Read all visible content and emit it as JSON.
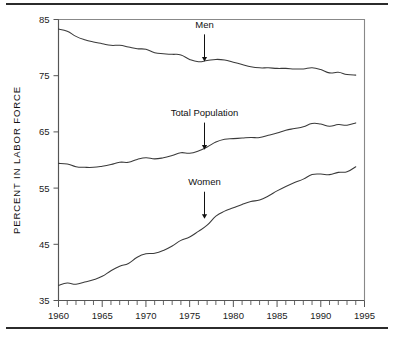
{
  "figure": {
    "background_color": "#ffffff",
    "rule_color": "#2b2b2b",
    "line_color": "#3a3a3a",
    "axis_color": "#555555"
  },
  "chart_data": {
    "type": "line",
    "title": "",
    "subtitle": "",
    "xlabel": "",
    "ylabel": "PERCENT IN LABOR FORCE",
    "xlim": [
      1960,
      1995
    ],
    "ylim": [
      35,
      85
    ],
    "grid": false,
    "legend_position": "inline-annotations",
    "x_ticks": [
      1960,
      1965,
      1970,
      1975,
      1980,
      1985,
      1990,
      1995
    ],
    "x_tick_labels": [
      "1960",
      "1965",
      "1970",
      "1975",
      "1980",
      "1985",
      "1990",
      "1995"
    ],
    "x_minor_tick_step": 1,
    "y_ticks": [
      35,
      45,
      55,
      65,
      75,
      85
    ],
    "y_tick_labels": [
      "35",
      "45",
      "55",
      "65",
      "75",
      "85"
    ],
    "x": [
      1960,
      1961,
      1962,
      1963,
      1964,
      1965,
      1966,
      1967,
      1968,
      1969,
      1970,
      1971,
      1972,
      1973,
      1974,
      1975,
      1976,
      1977,
      1978,
      1979,
      1980,
      1981,
      1982,
      1983,
      1984,
      1985,
      1986,
      1987,
      1988,
      1989,
      1990,
      1991,
      1992,
      1993,
      1994
    ],
    "series": [
      {
        "name": "Men",
        "label": "Men",
        "values": [
          83.3,
          82.9,
          82.0,
          81.4,
          81.0,
          80.7,
          80.4,
          80.4,
          80.1,
          79.8,
          79.7,
          79.1,
          78.9,
          78.8,
          78.7,
          77.9,
          77.5,
          77.7,
          77.9,
          77.8,
          77.4,
          77.0,
          76.6,
          76.4,
          76.4,
          76.3,
          76.3,
          76.2,
          76.2,
          76.4,
          76.1,
          75.5,
          75.6,
          75.2,
          75.1
        ]
      },
      {
        "name": "Total Population",
        "label": "Total Population",
        "values": [
          59.4,
          59.3,
          58.8,
          58.7,
          58.7,
          58.9,
          59.2,
          59.6,
          59.6,
          60.1,
          60.4,
          60.2,
          60.4,
          60.8,
          61.3,
          61.2,
          61.6,
          62.3,
          63.2,
          63.7,
          63.8,
          63.9,
          64.0,
          64.0,
          64.4,
          64.8,
          65.3,
          65.6,
          65.9,
          66.5,
          66.4,
          66.0,
          66.3,
          66.2,
          66.6
        ]
      },
      {
        "name": "Women",
        "label": "Women",
        "values": [
          37.7,
          38.1,
          37.9,
          38.3,
          38.7,
          39.3,
          40.3,
          41.1,
          41.6,
          42.7,
          43.3,
          43.4,
          43.9,
          44.7,
          45.7,
          46.3,
          47.3,
          48.4,
          50.0,
          50.9,
          51.5,
          52.1,
          52.6,
          52.9,
          53.6,
          54.5,
          55.3,
          56.0,
          56.6,
          57.4,
          57.5,
          57.4,
          57.8,
          57.9,
          58.8
        ]
      }
    ],
    "annotations": [
      {
        "text": "Men",
        "series": "Men",
        "x": 1976.7,
        "y": 77.6,
        "label_offset_percent": 5.2,
        "arrow": "down"
      },
      {
        "text": "Total Population",
        "series": "Total Population",
        "x": 1976.7,
        "y": 61.9,
        "label_offset_percent": 5.2,
        "arrow": "down"
      },
      {
        "text": "Women",
        "series": "Women",
        "x": 1976.7,
        "y": 49.6,
        "label_offset_percent": 5.2,
        "arrow": "down"
      }
    ]
  }
}
